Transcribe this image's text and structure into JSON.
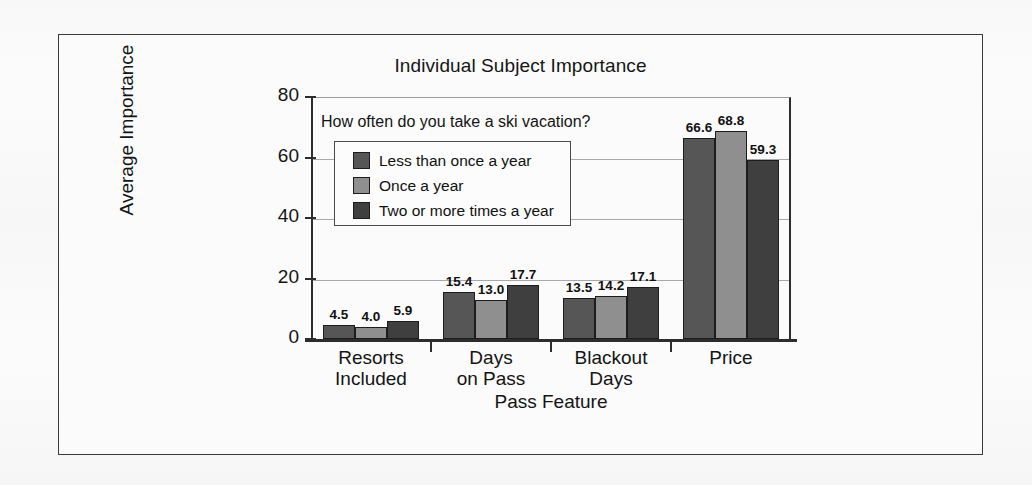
{
  "figure": {
    "background_color": "#fbfbfb",
    "border_color": "#3a3a3a"
  },
  "chart_data": {
    "type": "bar",
    "title": "Individual Subject Importance",
    "xlabel": "Pass Feature",
    "ylabel": "Average Importance",
    "categories": [
      "Resorts Included",
      "Days on Pass",
      "Blackout Days",
      "Price"
    ],
    "category_lines": [
      [
        "Resorts",
        "Included"
      ],
      [
        "Days",
        "on Pass"
      ],
      [
        "Blackout",
        "Days"
      ],
      [
        "Price",
        ""
      ]
    ],
    "ylim": [
      0,
      80
    ],
    "yticks": [
      0,
      20,
      40,
      60,
      80
    ],
    "ytick_labels": [
      "0",
      "20",
      "40",
      "60",
      "80"
    ],
    "grid": true,
    "legend_position": "upper left inside plot",
    "legend_title": "How often do you take a ski vacation?",
    "series": [
      {
        "name": "Less than once a year",
        "color": "#565656",
        "values": [
          4.5,
          15.4,
          13.5,
          66.6
        ],
        "labels": [
          "4.5",
          "15.4",
          "13.5",
          "66.6"
        ]
      },
      {
        "name": "Once a year",
        "color": "#8f8f8f",
        "values": [
          4.0,
          13.0,
          14.2,
          68.8
        ],
        "labels": [
          "4.0",
          "13.0",
          "14.2",
          "68.8"
        ]
      },
      {
        "name": "Two or more times a year",
        "color": "#3f3f3f",
        "values": [
          5.9,
          17.7,
          17.1,
          59.3
        ],
        "labels": [
          "5.9",
          "17.7",
          "17.1",
          "59.3"
        ]
      }
    ]
  }
}
